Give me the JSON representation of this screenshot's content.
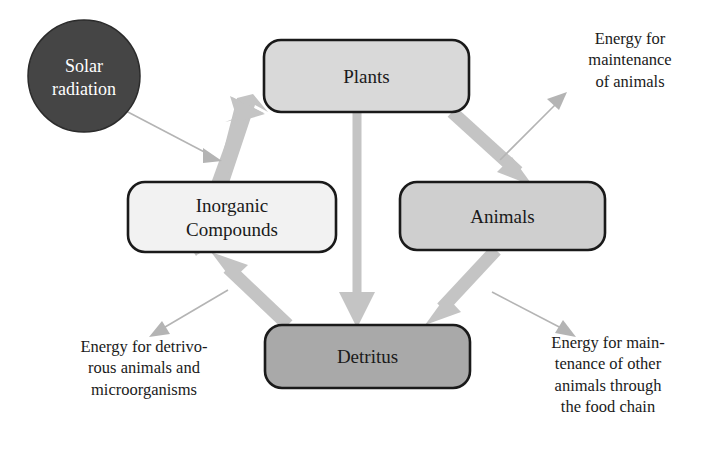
{
  "diagram": {
    "background_color": "#ffffff",
    "nodes": [
      {
        "id": "solar-radiation",
        "label": "Solar\nradiation",
        "shape": "circle",
        "fill": "#454545",
        "stroke": "#2b2b2b",
        "text_color": "#ffffff",
        "cx": 84,
        "cy": 76,
        "r": 56
      },
      {
        "id": "plants",
        "label": "Plants",
        "shape": "rounded-rect",
        "fill": "#d9d9d9",
        "stroke": "#1a1a1a",
        "text_color": "#1a1a1a",
        "x": 264,
        "y": 40,
        "width": 205,
        "height": 72
      },
      {
        "id": "inorganic-compounds",
        "label": "Inorganic\nCompounds",
        "shape": "rounded-rect",
        "fill": "#f2f2f2",
        "stroke": "#1a1a1a",
        "text_color": "#1a1a1a",
        "x": 128,
        "y": 182,
        "width": 208,
        "height": 70
      },
      {
        "id": "animals",
        "label": "Animals",
        "shape": "rounded-rect",
        "fill": "#cfcfcf",
        "stroke": "#1a1a1a",
        "text_color": "#1a1a1a",
        "x": 400,
        "y": 182,
        "width": 205,
        "height": 68
      },
      {
        "id": "detritus",
        "label": "Detritus",
        "shape": "rounded-rect",
        "fill": "#a9a9a9",
        "stroke": "#1a1a1a",
        "text_color": "#1a1a1a",
        "x": 265,
        "y": 325,
        "width": 205,
        "height": 63
      }
    ],
    "thick_arrows": [
      {
        "id": "inorganic-to-plants",
        "from": "inorganic-compounds",
        "to": "plants",
        "color": "#c4c4c4"
      },
      {
        "id": "plants-to-animals",
        "from": "plants",
        "to": "animals",
        "color": "#c4c4c4"
      },
      {
        "id": "plants-to-detritus",
        "from": "plants",
        "to": "detritus",
        "color": "#c4c4c4"
      },
      {
        "id": "animals-to-detritus",
        "from": "animals",
        "to": "detritus",
        "color": "#c4c4c4"
      },
      {
        "id": "detritus-to-inorganic",
        "from": "detritus",
        "to": "inorganic-compounds",
        "color": "#c4c4c4"
      }
    ],
    "thin_arrows": [
      {
        "id": "solar-to-plants-input",
        "from": "solar-radiation",
        "to": "inorganic-to-plants",
        "color": "#b0b0b0"
      },
      {
        "id": "animals-energy-out",
        "from": "plants-to-animals",
        "to": "caption-top-right",
        "color": "#b0b0b0"
      },
      {
        "id": "detritivore-energy-out",
        "from": "detritus-to-inorganic",
        "to": "caption-bottom-left",
        "color": "#b0b0b0"
      },
      {
        "id": "foodchain-energy-out",
        "from": "animals-to-detritus",
        "to": "caption-bottom-right",
        "color": "#b0b0b0"
      }
    ],
    "captions": {
      "top_right": "Energy for\nmaintenance\nof animals",
      "bottom_left": "Energy for detrivo-\nrous animals and\nmicroorganisms",
      "bottom_right": "Energy for main-\ntenance of other\nanimals through\nthe food chain"
    }
  }
}
